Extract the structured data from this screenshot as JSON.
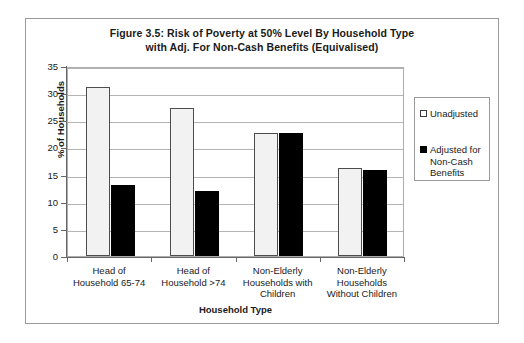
{
  "figure": {
    "title_line_1": "Figure 3.5: Risk of Poverty at 50% Level By Household Type",
    "title_line_2": "with Adj. For Non-Cash Benefits  (Equivalised)"
  },
  "chart_data": {
    "type": "bar",
    "title": "Figure 3.5: Risk of Poverty at 50% Level By Household Type with Adj. For Non-Cash Benefits  (Equivalised)",
    "xlabel": "Household Type",
    "ylabel": "% of Households",
    "ylim": [
      0,
      35
    ],
    "yticks": [
      0,
      5,
      10,
      15,
      20,
      25,
      30,
      35
    ],
    "ytick_labels": [
      "0",
      "5",
      "10",
      "15",
      "20",
      "25",
      "30",
      "35"
    ],
    "grid": true,
    "legend_position": "right",
    "categories": [
      "Head of Household 65-74",
      "Head of Household >74",
      "Non-Elderly Households with Children",
      "Non-Elderly Households Without Children"
    ],
    "category_lines": [
      [
        "Head of",
        "Household 65-74"
      ],
      [
        "Head of",
        "Household >74"
      ],
      [
        "Non-Elderly",
        "Households with",
        "Children"
      ],
      [
        "Non-Elderly",
        "Households",
        "Without Children"
      ]
    ],
    "series": [
      {
        "name": "Unadjusted",
        "color": "#f2f2f2",
        "values": [
          31.1,
          27.3,
          22.7,
          16.3
        ]
      },
      {
        "name": "Adjusted for Non-Cash Benefits",
        "color": "#000000",
        "values": [
          13.0,
          11.9,
          22.7,
          15.9
        ]
      }
    ]
  },
  "legend": {
    "entries": [
      {
        "label_lines": [
          "Unadjusted"
        ],
        "swatch": "unadjusted"
      },
      {
        "label_lines": [
          "Adjusted for",
          "Non-Cash",
          "Benefits"
        ],
        "swatch": "adjusted"
      }
    ]
  }
}
